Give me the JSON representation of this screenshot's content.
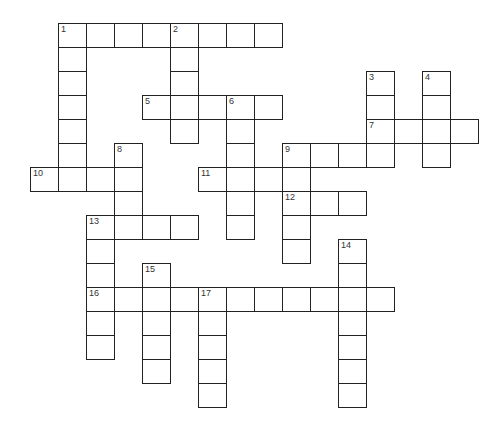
{
  "puzzle": {
    "layout": {
      "origin_x": 30,
      "origin_y": 23,
      "cell_w": 28,
      "cell_h": 24
    },
    "entries": [
      {
        "number": 1,
        "direction": "across",
        "row": 0,
        "col": 1,
        "length": 8
      },
      {
        "number": 1,
        "direction": "down",
        "row": 0,
        "col": 1,
        "length": 7
      },
      {
        "number": 2,
        "direction": "down",
        "row": 0,
        "col": 5,
        "length": 5
      },
      {
        "number": 3,
        "direction": "down",
        "row": 2,
        "col": 12,
        "length": 4
      },
      {
        "number": 4,
        "direction": "down",
        "row": 2,
        "col": 14,
        "length": 4
      },
      {
        "number": 5,
        "direction": "across",
        "row": 3,
        "col": 4,
        "length": 5
      },
      {
        "number": 6,
        "direction": "down",
        "row": 3,
        "col": 7,
        "length": 6
      },
      {
        "number": 7,
        "direction": "across",
        "row": 4,
        "col": 12,
        "length": 4
      },
      {
        "number": 8,
        "direction": "down",
        "row": 5,
        "col": 3,
        "length": 4
      },
      {
        "number": 9,
        "direction": "across",
        "row": 5,
        "col": 9,
        "length": 4
      },
      {
        "number": 9,
        "direction": "down",
        "row": 5,
        "col": 9,
        "length": 5
      },
      {
        "number": 10,
        "direction": "across",
        "row": 6,
        "col": 0,
        "length": 4
      },
      {
        "number": 11,
        "direction": "across",
        "row": 6,
        "col": 6,
        "length": 4
      },
      {
        "number": 12,
        "direction": "across",
        "row": 7,
        "col": 9,
        "length": 3
      },
      {
        "number": 13,
        "direction": "across",
        "row": 8,
        "col": 2,
        "length": 4
      },
      {
        "number": 13,
        "direction": "down",
        "row": 8,
        "col": 2,
        "length": 6
      },
      {
        "number": 14,
        "direction": "down",
        "row": 9,
        "col": 11,
        "length": 7
      },
      {
        "number": 15,
        "direction": "down",
        "row": 10,
        "col": 4,
        "length": 5
      },
      {
        "number": 16,
        "direction": "across",
        "row": 11,
        "col": 2,
        "length": 11
      },
      {
        "number": 17,
        "direction": "down",
        "row": 11,
        "col": 6,
        "length": 5
      }
    ]
  }
}
